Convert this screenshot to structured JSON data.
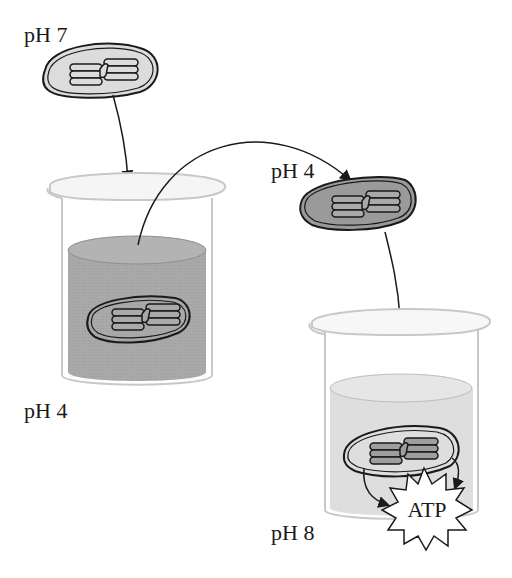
{
  "diagram": {
    "type": "chemiosmosis-experiment",
    "labels": {
      "initial_chloroplast_ph": "pH 7",
      "beaker1_solution_ph": "pH 4",
      "equilibrated_chloroplast_ph": "pH 4",
      "beaker2_solution_ph": "pH 8",
      "product": "ATP"
    },
    "colors": {
      "chloroplast_light_fill": "#dcdcdc",
      "chloroplast_dark_fill": "#9a9a9a",
      "acid_solution": "#a9a9a9",
      "basic_solution": "#dedede",
      "glass_outline": "#c8c8c8",
      "ink": "#1a1a1a"
    },
    "steps": [
      {
        "from": "chloroplast-ph7",
        "to": "beaker-ph4"
      },
      {
        "from": "beaker-ph4",
        "to": "chloroplast-ph4"
      },
      {
        "from": "chloroplast-ph4",
        "to": "beaker-ph8"
      },
      {
        "from": "chloroplast-in-ph8",
        "to": "atp-burst"
      }
    ]
  }
}
